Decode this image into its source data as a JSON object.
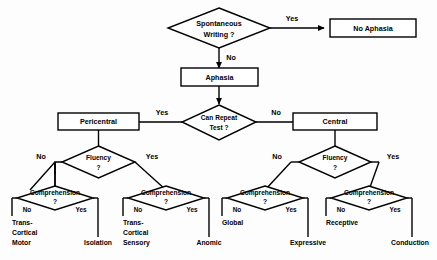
{
  "diagram": {
    "type": "decision-tree-flowchart",
    "colors": {
      "background": "#fdfdfd",
      "stroke": "#000000",
      "shape_fill": "#ffffff",
      "text": "#000000"
    },
    "nodes": {
      "spontaneous_writing": {
        "label_line1": "Spontaneous",
        "label_line2": "Writing  ?",
        "shape": "diamond"
      },
      "no_aphasia": {
        "label": "No Aphasia",
        "shape": "rectangle"
      },
      "aphasia": {
        "label": "Aphasia",
        "shape": "rectangle"
      },
      "can_repeat_test": {
        "label_line1": "Can Repeat",
        "label_line2": "Test ?",
        "shape": "diamond"
      },
      "pericentral": {
        "label": "Pericentral",
        "shape": "rectangle"
      },
      "central": {
        "label": "Central",
        "shape": "rectangle"
      },
      "fluency_left": {
        "label_line1": "Fluency",
        "label_line2": "?",
        "shape": "diamond"
      },
      "fluency_right": {
        "label_line1": "Fluency",
        "label_line2": "?",
        "shape": "diamond"
      },
      "comprehension_1": {
        "label_line1": "Comprehension",
        "label_line2": "?",
        "shape": "diamond"
      },
      "comprehension_2": {
        "label_line1": "Comprehension",
        "label_line2": "?",
        "shape": "diamond"
      },
      "comprehension_3": {
        "label_line1": "Comprehension",
        "label_line2": "?",
        "shape": "diamond"
      },
      "comprehension_4": {
        "label_line1": "Comprehension",
        "label_line2": "?",
        "shape": "diamond"
      }
    },
    "edge_labels": {
      "sw_yes": "Yes",
      "sw_no": "No",
      "repeat_yes": "Yes",
      "repeat_no": "No",
      "fluency_left_no": "No",
      "fluency_left_yes": "Yes",
      "fluency_right_no": "No",
      "fluency_right_yes": "Yes",
      "comp1_no": "No",
      "comp1_yes": "Yes",
      "comp2_no": "No",
      "comp2_yes": "Yes",
      "comp3_no": "No",
      "comp3_yes": "Yes",
      "comp4_no": "No",
      "comp4_yes": "Yes"
    },
    "leaves": {
      "trans_cortical_motor": {
        "line1": "Trans-",
        "line2": "Cortical",
        "line3": "Motor"
      },
      "isolation": {
        "line1": "Isolation"
      },
      "trans_cortical_sensory": {
        "line1": "Trans-",
        "line2": "Cortical",
        "line3": "Sensory"
      },
      "anomic": {
        "line1": "Anomic"
      },
      "global": {
        "line1": "Global"
      },
      "expressive": {
        "line1": "Expressive"
      },
      "receptive": {
        "line1": "Receptive"
      },
      "conduction": {
        "line1": "Conduction"
      }
    }
  }
}
